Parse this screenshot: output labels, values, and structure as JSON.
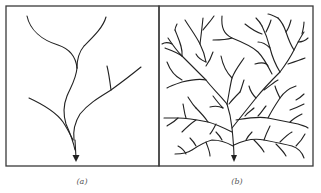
{
  "figure": {
    "panels": [
      {
        "id": "a",
        "label": "(a)",
        "description": "Sparse branching drainage network with few tributaries converging to a single outlet arrow"
      },
      {
        "id": "b",
        "label": "(b)",
        "description": "Dense dendritic drainage network with many tributaries converging to a single outlet arrow"
      }
    ],
    "colors": {
      "line": "#222222",
      "frame": "#3a3a3a",
      "label": "#555555",
      "background": "#ffffff"
    }
  }
}
